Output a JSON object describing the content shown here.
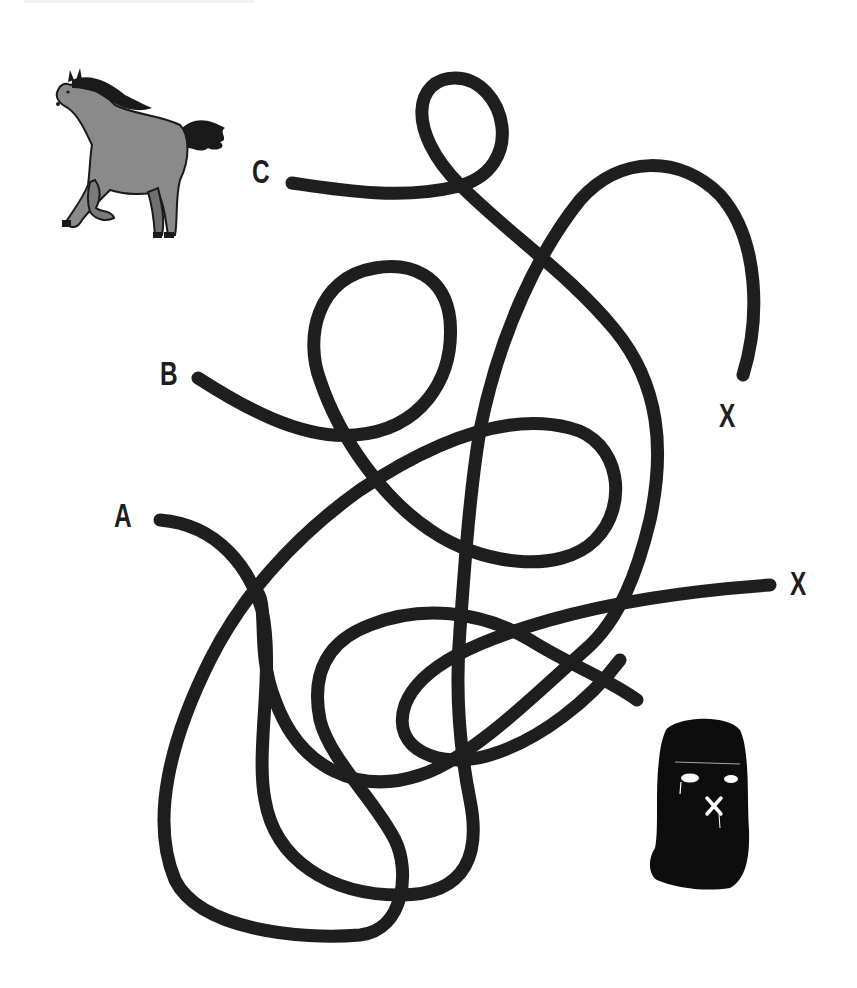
{
  "puzzle": {
    "type": "maze",
    "description": "Tangled-line maze: which line leads the horse to the thief?",
    "line_color": "#1e1e1e",
    "background_color": "#ffffff"
  },
  "start_labels": [
    {
      "id": "C",
      "text": "C",
      "x": 252,
      "y": 156
    },
    {
      "id": "B",
      "text": "B",
      "x": 160,
      "y": 356
    },
    {
      "id": "A",
      "text": "A",
      "x": 114,
      "y": 498
    }
  ],
  "end_labels": [
    {
      "id": "X1",
      "text": "X",
      "x": 719,
      "y": 400
    },
    {
      "id": "X2",
      "text": "X",
      "x": 790,
      "y": 566
    }
  ],
  "characters": {
    "horse": {
      "name": "horse",
      "color_body": "#8a8a8a",
      "color_mane": "#1a1a1a"
    },
    "thief": {
      "name": "ski-mask-thief",
      "color": "#0d0d0d",
      "mark": "X"
    }
  },
  "paths": [
    {
      "id": "path-c",
      "start": "C",
      "d": "M 292 183 C 340 190 400 200 455 187 C 530 170 505 78 455 78 C 415 78 405 130 460 185 C 510 235 570 275 615 330 C 660 385 665 450 650 520 C 638 570 620 620 585 650 C 540 690 470 760 420 775 C 360 795 300 770 275 700 C 255 650 270 600 255 590"
    },
    {
      "id": "path-b",
      "start": "B",
      "d": "M 198 378 C 240 405 300 440 355 435 C 420 430 455 380 450 320 C 445 275 410 262 375 268 C 315 278 305 340 320 380 C 340 440 385 500 430 530 C 480 565 560 575 595 540 C 630 505 620 440 570 428 C 500 410 420 450 360 490 C 290 540 240 600 210 660 C 170 740 150 820 175 880 C 200 930 300 940 360 935 C 405 930 410 870 395 840 C 375 800 330 760 320 720 C 310 670 330 640 370 625 C 420 605 480 610 530 640 C 570 665 610 680 637 700"
    },
    {
      "id": "path-a",
      "start": "A",
      "d": "M 160 520 C 220 525 250 570 262 610 C 275 670 255 750 265 800 C 275 860 330 895 400 895 C 470 895 480 850 470 800 C 460 750 455 690 460 630 C 465 560 470 490 480 430 C 500 330 540 250 580 200 C 620 155 680 155 720 195 C 760 240 760 320 743 375"
    },
    {
      "id": "path-x2",
      "start": "X2",
      "d": "M 770 585 C 700 590 620 600 550 620 C 480 640 420 665 405 705 C 390 750 440 770 490 755 C 540 740 590 700 620 660"
    }
  ]
}
